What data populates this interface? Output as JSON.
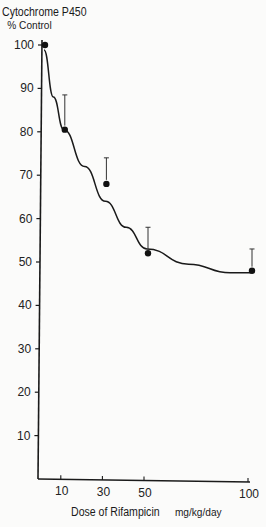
{
  "chart_data": {
    "type": "line",
    "title": "",
    "ylabel": "Cytochrome P450 % Control",
    "ylabel_line1": "Cytochrome P450",
    "ylabel_line2": "% Control",
    "xlabel": "Dose of Rifampicin",
    "xlabel_unit": "mg/kg/day",
    "x_ticks": [
      "10",
      "30",
      "50",
      "100"
    ],
    "y_ticks": [
      "10",
      "20",
      "30",
      "40",
      "50",
      "60",
      "70",
      "80",
      "90",
      "100"
    ],
    "ylim": [
      0,
      100
    ],
    "xlim": [
      0,
      100
    ],
    "grid": false,
    "legend": "none",
    "series": [
      {
        "name": "Measured",
        "style": "points with upper error bars",
        "x": [
          0,
          10,
          30,
          50,
          100
        ],
        "y": [
          100,
          80.5,
          68,
          52,
          48
        ],
        "error_upper": [
          null,
          88.5,
          74,
          58,
          53
        ]
      },
      {
        "name": "Fitted curve",
        "style": "smooth line",
        "x": [
          1,
          5,
          10,
          20,
          30,
          40,
          50,
          70,
          90,
          100
        ],
        "y": [
          98.5,
          88,
          80.5,
          72,
          64,
          58,
          53,
          49.5,
          47.5,
          47.5
        ]
      }
    ]
  }
}
